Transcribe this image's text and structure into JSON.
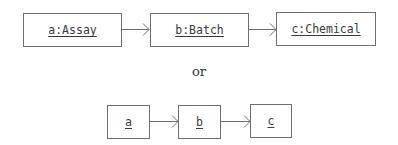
{
  "diagram": {
    "row1": {
      "nodes": [
        {
          "id": "a",
          "label": "a:Assay"
        },
        {
          "id": "b",
          "label": "b:Batch"
        },
        {
          "id": "c",
          "label": "c:Chemical"
        }
      ],
      "edges": [
        [
          "a",
          "b"
        ],
        [
          "b",
          "c"
        ]
      ]
    },
    "separator": "or",
    "row2": {
      "nodes": [
        {
          "id": "a",
          "label": "a"
        },
        {
          "id": "b",
          "label": "b"
        },
        {
          "id": "c",
          "label": "c"
        }
      ],
      "edges": [
        [
          "a",
          "b"
        ],
        [
          "b",
          "c"
        ]
      ]
    },
    "colors": {
      "stroke": "#6e6e6e",
      "text": "#3a3a3a"
    }
  }
}
